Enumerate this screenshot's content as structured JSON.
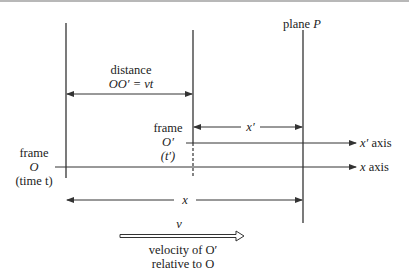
{
  "diagram": {
    "labels": {
      "plane": "plane",
      "plane_symbol": "P",
      "distance_word": "distance",
      "distance_formula": "OO′ = vt",
      "frame_o_prime_word": "frame",
      "frame_o_prime_symbol": "O′",
      "frame_o_prime_time": "(t′)",
      "frame_o_word": "frame",
      "frame_o_symbol": "O",
      "frame_o_time": "(time t)",
      "x_prime_dim": "x′",
      "x_dim": "x",
      "x_prime_axis_symbol": "x′",
      "x_prime_axis_word": "axis",
      "x_axis_symbol": "x",
      "x_axis_word": "axis",
      "velocity_symbol": "v",
      "velocity_line1": "velocity of O′",
      "velocity_line2": "relative to O"
    },
    "colors": {
      "line": "#333333",
      "text": "#222222",
      "top_rule": "#b8b8b8"
    }
  }
}
